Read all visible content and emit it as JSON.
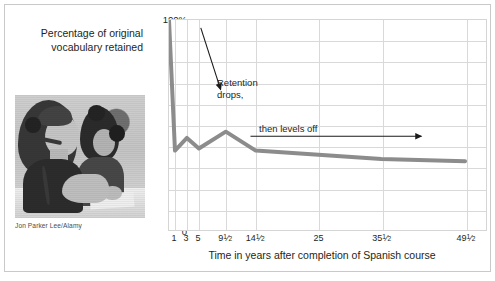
{
  "figure": {
    "caption": "Percentage of\noriginal vocabulary\nretained",
    "photo_credit": "Jon Parker Lee/Alamy",
    "photo_alt": "students-in-language-lab-photo",
    "border_color": "#c9c9c9"
  },
  "annotations": [
    {
      "id": "retention-drops",
      "text": "Retention\ndrops,"
    },
    {
      "id": "then-levels-off",
      "text": "then levels off"
    }
  ],
  "chart_data": {
    "type": "line",
    "title": "",
    "subtitle": "",
    "xlabel": "Time in years after completion of Spanish course",
    "ylabel": "Percentage of original vocabulary retained",
    "xtick_labels": [
      "1",
      "3",
      "5",
      "9½",
      "14½",
      "25",
      "35½",
      "49½"
    ],
    "x": [
      0,
      1,
      3,
      5,
      9.5,
      14.5,
      25,
      35.5,
      49.5
    ],
    "values": [
      100,
      38,
      44,
      39,
      47,
      38,
      36,
      34,
      33
    ],
    "ytick_labels": [
      "0",
      "10",
      "20",
      "30",
      "40",
      "50",
      "60",
      "70",
      "80",
      "90",
      "100%"
    ],
    "yticks": [
      0,
      10,
      20,
      30,
      40,
      50,
      60,
      70,
      80,
      90,
      100
    ],
    "ylim": [
      0,
      100
    ],
    "grid": true,
    "legend": "none",
    "line_color": "#8c8c8c",
    "grid_color": "#d9d9d9",
    "axis_color": "#d5d5d5",
    "text_color": "#231f20"
  }
}
